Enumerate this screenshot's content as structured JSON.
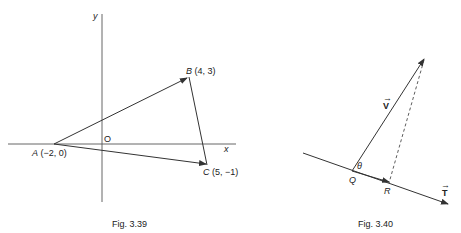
{
  "figures": [
    {
      "caption": "Fig. 3.39",
      "axes": {
        "x_label": "x",
        "y_label": "y",
        "origin_label": "O"
      },
      "points": {
        "A": {
          "name": "A",
          "coords": "(−2, 0)",
          "x": -2,
          "y": 0
        },
        "B": {
          "name": "B",
          "coords": "(4, 3)",
          "x": 4,
          "y": 3
        },
        "C": {
          "name": "C",
          "coords": "(5, −1)",
          "x": 5,
          "y": -1
        }
      },
      "vectors": [
        "AB",
        "AC"
      ],
      "segments": [
        "BC"
      ]
    },
    {
      "caption": "Fig. 3.40",
      "vector_V": "V",
      "vector_T": "T",
      "arrow_mark": "→",
      "point_Q": "Q",
      "point_R": "R",
      "angle": "θ"
    }
  ],
  "colors": {
    "ink": "#333333",
    "background": "#ffffff"
  }
}
